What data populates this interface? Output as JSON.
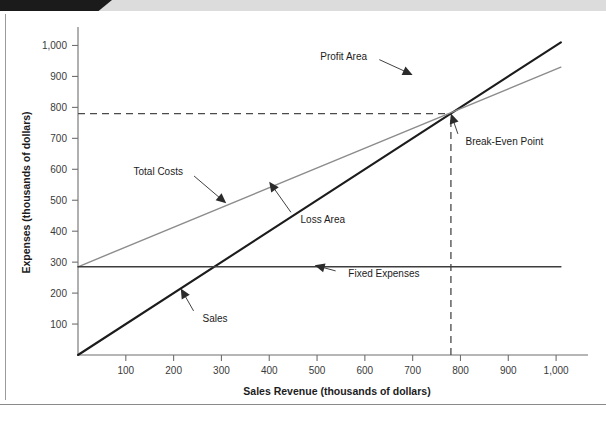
{
  "page": {
    "background_color": "#ffffff",
    "top_accent_color": "#1b1b1b",
    "top_band_color": "#dcdcdc",
    "rule_color": "#8a8a8a"
  },
  "chart_data": {
    "type": "line",
    "title": "",
    "subtitle": "",
    "xlabel": "Sales Revenue (thousands of dollars)",
    "ylabel": "Expenses (thousands of dollars)",
    "xlim": [
      0,
      1050
    ],
    "ylim": [
      0,
      1050
    ],
    "xticks": [
      100,
      200,
      300,
      400,
      500,
      600,
      700,
      800,
      900,
      1000
    ],
    "xticklabels": [
      "100",
      "200",
      "300",
      "400",
      "500",
      "600",
      "700",
      "800",
      "900",
      "1,000"
    ],
    "yticks": [
      100,
      200,
      300,
      400,
      500,
      600,
      700,
      800,
      900,
      1000
    ],
    "yticklabels": [
      "100",
      "200",
      "300",
      "400",
      "500",
      "600",
      "700",
      "800",
      "900",
      "1,000"
    ],
    "grid": false,
    "legend": "none",
    "legend_position": "none",
    "series": [
      {
        "name": "Sales",
        "color": "#1c1c1c",
        "style": "solid",
        "width": 2.1,
        "x": [
          0,
          1010
        ],
        "values": [
          0,
          1010
        ]
      },
      {
        "name": "Total Costs",
        "color": "#8c8c8c",
        "style": "solid",
        "width": 1.4,
        "x": [
          0,
          1010
        ],
        "values": [
          285,
          930
        ]
      },
      {
        "name": "Fixed Expenses",
        "color": "#3d3d3d",
        "style": "solid",
        "width": 1.5,
        "x": [
          0,
          1010
        ],
        "values": [
          285,
          285
        ]
      }
    ],
    "break_even_point": {
      "x": 780,
      "y": 780,
      "label": "Break-Even Point"
    },
    "guides": [
      {
        "type": "horizontal-dashed",
        "y": 780,
        "from_x": 0,
        "to_x": 780
      },
      {
        "type": "vertical-dashed",
        "x": 780,
        "from_y": 0,
        "to_y": 780
      }
    ],
    "annotations": [
      {
        "id": "profit-area",
        "text": "Profit Area",
        "label_x": 615,
        "label_y": 965,
        "target_x": 700,
        "target_y": 905
      },
      {
        "id": "break-even",
        "text": "Break-Even Point",
        "label_x": 800,
        "label_y": 690,
        "target_x": 780,
        "target_y": 780
      },
      {
        "id": "total-costs",
        "text": "Total Costs",
        "label_x": 230,
        "label_y": 595,
        "target_x": 310,
        "target_y": 490
      },
      {
        "id": "loss-area",
        "text": "Loss Area",
        "label_x": 455,
        "label_y": 440,
        "target_x": 400,
        "target_y": 560
      },
      {
        "id": "fixed-expenses",
        "text": "Fixed Expenses",
        "label_x": 555,
        "label_y": 265,
        "target_x": 495,
        "target_y": 290
      },
      {
        "id": "sales",
        "text": "Sales",
        "label_x": 250,
        "label_y": 120,
        "target_x": 215,
        "target_y": 215
      }
    ]
  }
}
